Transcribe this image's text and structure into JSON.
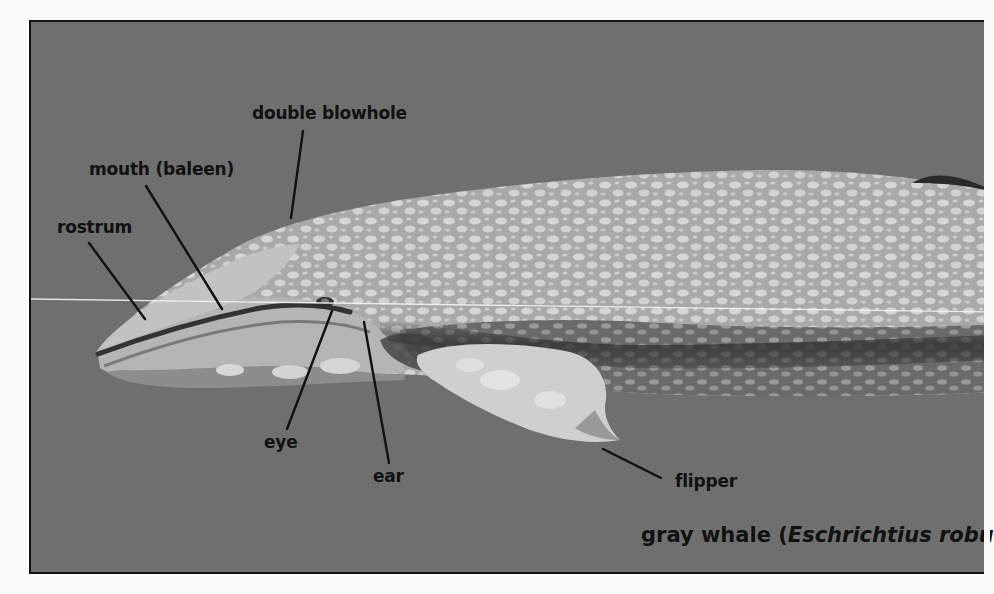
{
  "diagram": {
    "caption": {
      "common_name": "gray whale (",
      "scientific_name": "Eschrichtius robu"
    },
    "labels": [
      {
        "id": "double-blowhole",
        "text": "double blowhole"
      },
      {
        "id": "mouth",
        "text": "mouth (baleen)"
      },
      {
        "id": "rostrum",
        "text": "rostrum"
      },
      {
        "id": "eye",
        "text": "eye"
      },
      {
        "id": "ear",
        "text": "ear"
      },
      {
        "id": "flipper",
        "text": "flipper"
      }
    ],
    "colors": {
      "background": "#6f6f6f",
      "frame_border": "#111111",
      "whale_light": "#c9c9c9",
      "whale_dark": "#3c3c3c",
      "text": "#111111"
    }
  }
}
